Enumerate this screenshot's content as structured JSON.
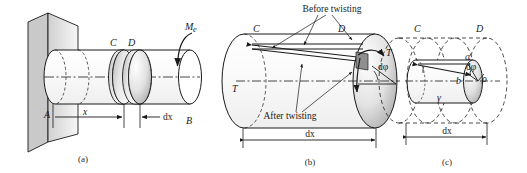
{
  "figure": {
    "panels": [
      {
        "id": "a",
        "caption": "(a)",
        "labels": {
          "fixed_end": "A",
          "free_end": "B",
          "section_c": "C",
          "section_d": "D",
          "torque": "M",
          "torque_sub": "e",
          "dim_x": "x",
          "dim_dx": "dx"
        }
      },
      {
        "id": "b",
        "caption": "(b)",
        "labels": {
          "section_c": "C",
          "section_d": "D",
          "shear_left": "T",
          "shear_right": "T",
          "twist_angle": "dφ",
          "before": "Before twisting",
          "after": "After twisting",
          "dim_dx": "dx"
        }
      },
      {
        "id": "c",
        "caption": "(c)",
        "labels": {
          "section_c": "C",
          "section_d": "D",
          "point_a": "a",
          "point_b": "b",
          "twist_angle": "dφ",
          "radius": "ρ",
          "shear_strain": "γ",
          "dim_dx": "dx"
        }
      }
    ],
    "colors": {
      "stroke": "#1a1a1a",
      "background": "#ffffff",
      "shade_light": "#f2f2f2",
      "shade_mid": "#d8d8d8",
      "shade_dark": "#9a9a9a"
    }
  }
}
